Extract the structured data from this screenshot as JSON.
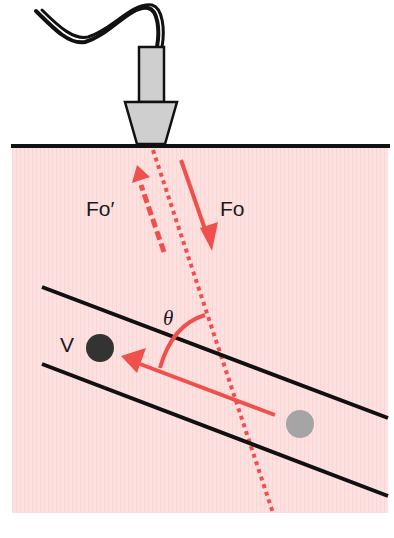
{
  "diagram": {
    "colors": {
      "tissue_fill": "#fde0e0",
      "beam_red": "#f0504c",
      "vessel_wall": "#111111",
      "probe_fill": "#cfcfcf",
      "cable": "#111111",
      "rbc_moving": "#333333",
      "rbc_origin": "#a5a5a5"
    },
    "labels": {
      "reflected_frequency": "Fo′",
      "transmitted_frequency": "Fo",
      "angle": "θ",
      "velocity": "V"
    },
    "elements": [
      {
        "name": "transducer-probe",
        "description": "ultrasound probe with cable on skin surface"
      },
      {
        "name": "skin-surface",
        "description": "horizontal black line"
      },
      {
        "name": "ultrasound-beam",
        "description": "dotted red line through tissue"
      },
      {
        "name": "transmitted-arrow",
        "description": "solid red arrow pointing into tissue",
        "label": "Fo"
      },
      {
        "name": "reflected-arrow",
        "description": "dashed red arrow pointing toward probe",
        "label": "Fo′"
      },
      {
        "name": "blood-vessel",
        "description": "two parallel diagonal black walls"
      },
      {
        "name": "velocity-arrow",
        "description": "red arrow along vessel",
        "label": "V"
      },
      {
        "name": "insonation-angle-arc",
        "description": "red arc between beam and flow",
        "label": "θ"
      }
    ]
  }
}
